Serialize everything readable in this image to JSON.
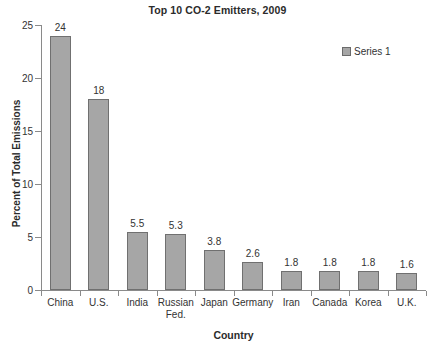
{
  "chart_data": {
    "type": "bar",
    "title": "Top 10 CO-2 Emitters, 2009",
    "xlabel": "Country",
    "ylabel": "Percent of Total Emissions",
    "categories": [
      "China",
      "U.S.",
      "India",
      "Russian Fed.",
      "Japan",
      "Germany",
      "Iran",
      "Canada",
      "Korea",
      "U.K."
    ],
    "values": [
      24,
      18,
      5.5,
      5.3,
      3.8,
      2.6,
      1.8,
      1.8,
      1.8,
      1.6
    ],
    "value_labels": [
      "24",
      "18",
      "5.5",
      "5.3",
      "3.8",
      "2.6",
      "1.8",
      "1.8",
      "1.8",
      "1.6"
    ],
    "ylim": [
      0,
      25
    ],
    "yticks": [
      0,
      5,
      10,
      15,
      20,
      25
    ],
    "ytick_labels": [
      "0",
      "5",
      "10",
      "15",
      "20",
      "25"
    ],
    "grid": false,
    "legend": {
      "position": "top-right",
      "entries": [
        {
          "label": "Series 1",
          "color": "#a6a6a6"
        }
      ]
    },
    "series": [
      {
        "name": "Series 1",
        "color": "#a6a6a6",
        "border_color": "#707070",
        "values": [
          24,
          18,
          5.5,
          5.3,
          3.8,
          2.6,
          1.8,
          1.8,
          1.8,
          1.6
        ]
      }
    ]
  },
  "colors": {
    "bar_fill": "#a6a6a6",
    "bar_border": "#707070",
    "axis": "#8a8a8a",
    "text": "#333333",
    "background": "#ffffff"
  }
}
